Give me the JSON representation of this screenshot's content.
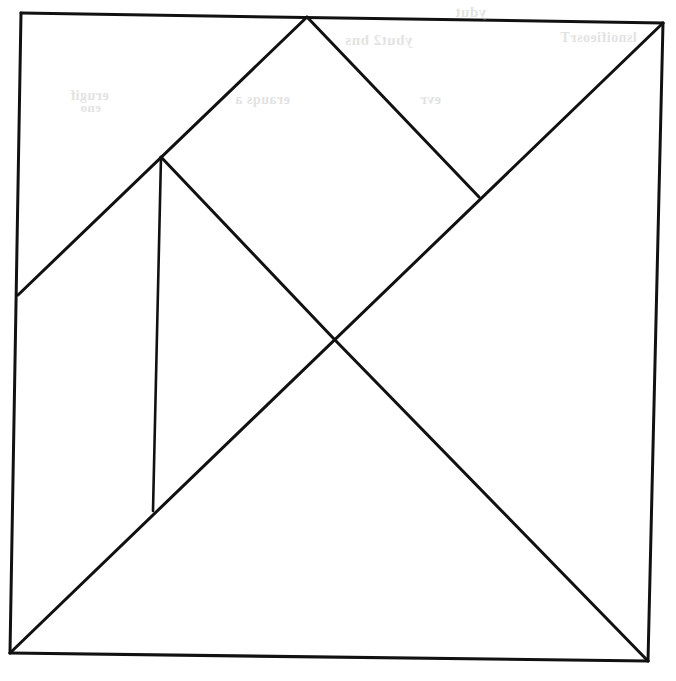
{
  "figure": {
    "name": "tangram-dissection",
    "background_color": "#ffffff",
    "stroke_color": "#111111",
    "canvas": {
      "width": 676,
      "height": 681
    }
  },
  "geometry": {
    "vertices": {
      "top_left_corner": {
        "label": "top-left corner",
        "x": 21,
        "y": 13
      },
      "top_right_corner": {
        "label": "top-right corner",
        "x": 663,
        "y": 23
      },
      "bottom_right_corner": {
        "label": "bottom-right corner",
        "x": 648,
        "y": 661
      },
      "bottom_left_corner": {
        "label": "bottom-left corner",
        "x": 10,
        "y": 653
      },
      "top_apex": {
        "label": "top edge apex",
        "x": 307,
        "y": 17
      },
      "left_edge_point": {
        "label": "left edge midpoint",
        "x": 18,
        "y": 295
      },
      "upper_left_junction": {
        "label": "upper-left three-way junction",
        "x": 161,
        "y": 157
      },
      "right_tee_junction": {
        "label": "right T-junction on main diagonal",
        "x": 479,
        "y": 197
      },
      "center_crossing": {
        "label": "center crossing",
        "x": 335,
        "y": 340
      },
      "vertical_foot": {
        "label": "foot of vertical line",
        "x": 153,
        "y": 511
      }
    },
    "segments": [
      {
        "name": "square-edge-top",
        "from": "top_left_corner",
        "to": "top_right_corner",
        "stroke_width": 3.0
      },
      {
        "name": "square-edge-right",
        "from": "top_right_corner",
        "to": "bottom_right_corner",
        "stroke_width": 3.0
      },
      {
        "name": "square-edge-bottom",
        "from": "bottom_right_corner",
        "to": "bottom_left_corner",
        "stroke_width": 3.2
      },
      {
        "name": "square-edge-left",
        "from": "bottom_left_corner",
        "to": "top_left_corner",
        "stroke_width": 3.0
      },
      {
        "name": "main-diagonal",
        "from": "top_right_corner",
        "to": "bottom_left_corner",
        "stroke_width": 3.0
      },
      {
        "name": "left-rising-diagonal",
        "from": "left_edge_point",
        "to": "top_apex",
        "stroke_width": 3.0
      },
      {
        "name": "apex-to-right-tee",
        "from": "top_apex",
        "to": "right_tee_junction",
        "stroke_width": 3.0
      },
      {
        "name": "upper-left-to-center",
        "from": "upper_left_junction",
        "to": "center_crossing",
        "stroke_width": 3.0
      },
      {
        "name": "center-to-bottom-right",
        "from": "center_crossing",
        "to": "bottom_right_corner",
        "stroke_width": 3.0
      },
      {
        "name": "vertical-divider",
        "from": "upper_left_junction",
        "to": "vertical_foot",
        "stroke_width": 2.6
      }
    ]
  },
  "ghost_text": {
    "note": "faint mirrored bleed-through from the reverse side of the page; illegible",
    "items": [
      {
        "text": "ydut",
        "x": 455,
        "y": 4,
        "size": 15
      },
      {
        "text": "ybut2 bns",
        "x": 345,
        "y": 32,
        "size": 15
      },
      {
        "text": "lsnoifieosrT",
        "x": 560,
        "y": 30,
        "size": 14
      },
      {
        "text": "erugif",
        "x": 70,
        "y": 88,
        "size": 14
      },
      {
        "text": "erauqs a",
        "x": 235,
        "y": 92,
        "size": 14
      },
      {
        "text": "evr",
        "x": 420,
        "y": 92,
        "size": 14
      },
      {
        "text": "eno",
        "x": 80,
        "y": 100,
        "size": 13
      }
    ]
  }
}
